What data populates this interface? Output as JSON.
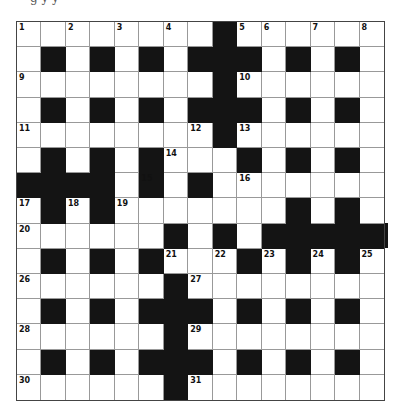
{
  "puzzle": {
    "type": "crossword",
    "size": 15,
    "header_sliver_text": "g      y  y",
    "colors": {
      "black_cell": "#141414",
      "white_cell": "#ffffff",
      "grid_line": "#999999",
      "border": "#444444"
    },
    "rows": [
      "........#......",
      ".#.#.#.###.#.#.",
      "........#......",
      ".#.#.#.###.#.#.",
      "........#......",
      ".#.#.#...#.#.#.",
      "####.#.#.......",
      ".#.#.......#.#.",
      "......#.#.#####",
      ".#.#.#...#.#.#.",
      "......#........",
      ".#.#.###.#.#.#.",
      "......#........",
      ".#.#.###.#.#.#.",
      "......#........"
    ],
    "numbers": [
      {
        "n": "1",
        "r": 0,
        "c": 0
      },
      {
        "n": "2",
        "r": 0,
        "c": 2
      },
      {
        "n": "3",
        "r": 0,
        "c": 4
      },
      {
        "n": "4",
        "r": 0,
        "c": 6
      },
      {
        "n": "5",
        "r": 0,
        "c": 9
      },
      {
        "n": "6",
        "r": 0,
        "c": 10
      },
      {
        "n": "7",
        "r": 0,
        "c": 12
      },
      {
        "n": "8",
        "r": 0,
        "c": 14
      },
      {
        "n": "9",
        "r": 2,
        "c": 0
      },
      {
        "n": "10",
        "r": 2,
        "c": 9
      },
      {
        "n": "11",
        "r": 4,
        "c": 0
      },
      {
        "n": "12",
        "r": 4,
        "c": 7
      },
      {
        "n": "13",
        "r": 4,
        "c": 9
      },
      {
        "n": "14",
        "r": 5,
        "c": 6
      },
      {
        "n": "15",
        "r": 6,
        "c": 5
      },
      {
        "n": "16",
        "r": 6,
        "c": 9
      },
      {
        "n": "17",
        "r": 7,
        "c": 0
      },
      {
        "n": "18",
        "r": 7,
        "c": 2
      },
      {
        "n": "19",
        "r": 7,
        "c": 4
      },
      {
        "n": "20",
        "r": 8,
        "c": 0
      },
      {
        "n": "21",
        "r": 9,
        "c": 6
      },
      {
        "n": "22",
        "r": 9,
        "c": 8
      },
      {
        "n": "23",
        "r": 9,
        "c": 10
      },
      {
        "n": "24",
        "r": 9,
        "c": 12
      },
      {
        "n": "25",
        "r": 9,
        "c": 14
      },
      {
        "n": "26",
        "r": 10,
        "c": 0
      },
      {
        "n": "27",
        "r": 10,
        "c": 7
      },
      {
        "n": "28",
        "r": 12,
        "c": 0
      },
      {
        "n": "29",
        "r": 12,
        "c": 7
      },
      {
        "n": "30",
        "r": 14,
        "c": 0
      },
      {
        "n": "31",
        "r": 14,
        "c": 7
      }
    ]
  }
}
